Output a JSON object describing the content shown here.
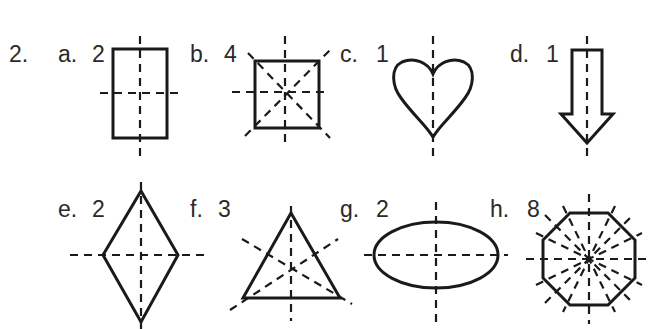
{
  "problem_number": "2.",
  "items": [
    {
      "letter": "a.",
      "answer": "2",
      "shape": "rectangle",
      "lines_of_symmetry": 2
    },
    {
      "letter": "b.",
      "answer": "4",
      "shape": "square",
      "lines_of_symmetry": 4
    },
    {
      "letter": "c.",
      "answer": "1",
      "shape": "heart",
      "lines_of_symmetry": 1
    },
    {
      "letter": "d.",
      "answer": "1",
      "shape": "down-arrow",
      "lines_of_symmetry": 1
    },
    {
      "letter": "e.",
      "answer": "2",
      "shape": "rhombus",
      "lines_of_symmetry": 2
    },
    {
      "letter": "f.",
      "answer": "3",
      "shape": "equilateral-triangle",
      "lines_of_symmetry": 3
    },
    {
      "letter": "g.",
      "answer": "2",
      "shape": "ellipse",
      "lines_of_symmetry": 2
    },
    {
      "letter": "h.",
      "answer": "8",
      "shape": "regular-octagon",
      "lines_of_symmetry": 8
    }
  ],
  "colors": {
    "ink": "#1a1a1a",
    "text": "#2a2a2a",
    "background": "#ffffff"
  }
}
